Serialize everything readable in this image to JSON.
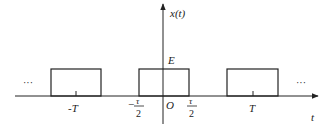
{
  "diagram": {
    "type": "periodic-rectangular-pulse-train",
    "y_axis_label": "x(t)",
    "x_axis_label": "t",
    "amplitude_label": "E",
    "origin_label": "O",
    "left_period_label": "-T",
    "right_period_label": "T",
    "pulse_left_edge": {
      "sign": "−",
      "numerator": "τ",
      "denominator": "2"
    },
    "pulse_right_edge": {
      "numerator": "τ",
      "denominator": "2"
    },
    "continuation_left": "···",
    "continuation_right": "···",
    "colors": {
      "line": "#222222",
      "background": "#ffffff"
    }
  }
}
